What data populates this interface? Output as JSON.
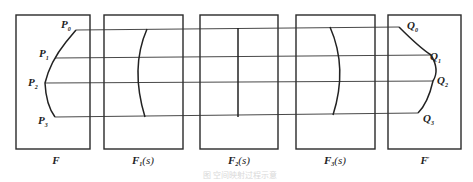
{
  "figure": {
    "panels": [
      {
        "id": "F",
        "label_main": "F",
        "label_sub": "",
        "label_suffix": "",
        "x": 16,
        "w": 74
      },
      {
        "id": "F1",
        "label_main": "F",
        "label_sub": "1",
        "label_suffix": "(s)",
        "x": 104,
        "w": 79
      },
      {
        "id": "F2",
        "label_main": "F",
        "label_sub": "2",
        "label_suffix": "(s)",
        "x": 200,
        "w": 78
      },
      {
        "id": "F3",
        "label_main": "F",
        "label_sub": "3",
        "label_suffix": "(s)",
        "x": 296,
        "w": 79
      },
      {
        "id": "Fprime",
        "label_main": "F",
        "label_sub": "",
        "label_suffix": "′",
        "x": 388,
        "w": 73
      }
    ],
    "source_points": [
      {
        "main": "P",
        "sub": "0"
      },
      {
        "main": "P",
        "sub": "1"
      },
      {
        "main": "P",
        "sub": "2"
      },
      {
        "main": "P",
        "sub": "3"
      }
    ],
    "target_points": [
      {
        "main": "Q",
        "sub": "0"
      },
      {
        "main": "Q",
        "sub": "1"
      },
      {
        "main": "Q",
        "sub": "2"
      },
      {
        "main": "Q",
        "sub": "3"
      }
    ],
    "caption": "图  空间映射过程示意"
  }
}
